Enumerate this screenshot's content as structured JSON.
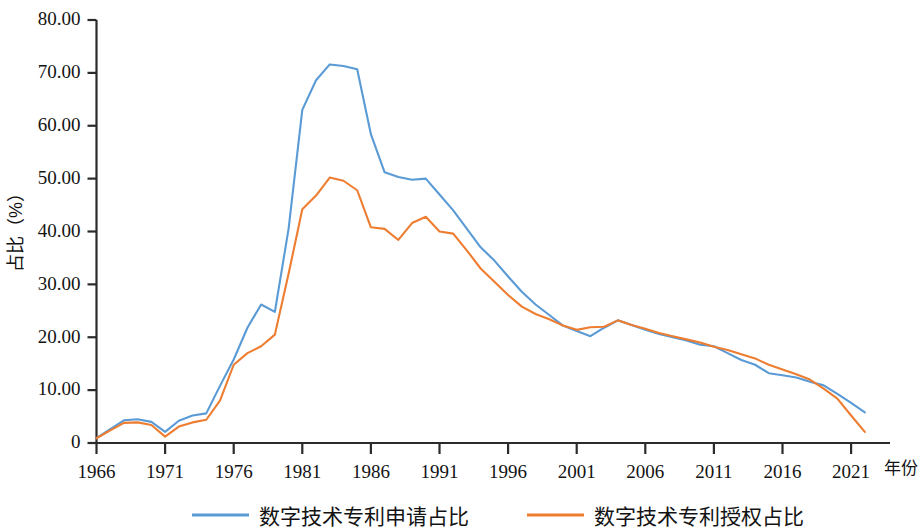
{
  "chart_data": {
    "type": "line",
    "title": "",
    "xlabel": "年份",
    "ylabel": "占比（%）",
    "xlim": [
      1966,
      2022
    ],
    "ylim": [
      0,
      80
    ],
    "grid": false,
    "legend_position": "bottom",
    "x_ticks": [
      "1966",
      "1971",
      "1976",
      "1981",
      "1986",
      "1991",
      "1996",
      "2001",
      "2006",
      "2011",
      "2016",
      "2021"
    ],
    "x_tick_values": [
      1966,
      1971,
      1976,
      1981,
      1986,
      1991,
      1996,
      2001,
      2006,
      2011,
      2016,
      2021
    ],
    "y_ticks": [
      "0",
      "10.00",
      "20.00",
      "30.00",
      "40.00",
      "50.00",
      "60.00",
      "70.00",
      "80.00"
    ],
    "y_tick_values": [
      0,
      10,
      20,
      30,
      40,
      50,
      60,
      70,
      80
    ],
    "x": [
      1966,
      1967,
      1968,
      1969,
      1970,
      1971,
      1972,
      1973,
      1974,
      1975,
      1976,
      1977,
      1978,
      1979,
      1980,
      1981,
      1982,
      1983,
      1984,
      1985,
      1986,
      1987,
      1988,
      1989,
      1990,
      1991,
      1992,
      1993,
      1994,
      1995,
      1996,
      1997,
      1998,
      1999,
      2000,
      2001,
      2002,
      2003,
      2004,
      2005,
      2006,
      2007,
      2008,
      2009,
      2010,
      2011,
      2012,
      2013,
      2014,
      2015,
      2016,
      2017,
      2018,
      2019,
      2020,
      2021,
      2022
    ],
    "series": [
      {
        "name": "数字技术专利申请占比",
        "color": "#5B9BD5",
        "values": [
          0.9,
          2.6,
          4.3,
          4.5,
          4.0,
          2.1,
          4.2,
          5.2,
          5.6,
          10.8,
          15.8,
          21.8,
          26.2,
          24.8,
          40.5,
          63.0,
          68.6,
          71.6,
          71.3,
          70.7,
          58.4,
          51.2,
          50.3,
          49.8,
          50.0,
          47.0,
          44.0,
          40.5,
          37.0,
          34.5,
          31.5,
          28.6,
          26.2,
          24.2,
          22.2,
          21.2,
          20.2,
          21.8,
          23.2,
          22.3,
          21.4,
          20.6,
          20.0,
          19.4,
          18.6,
          18.3,
          17.0,
          15.7,
          14.8,
          13.2,
          12.8,
          12.4,
          11.6,
          10.9,
          9.3,
          7.6,
          5.8
        ]
      },
      {
        "name": "数字技术专利授权占比",
        "color": "#ED7D31",
        "values": [
          0.9,
          2.4,
          3.8,
          3.9,
          3.4,
          1.2,
          3.1,
          3.9,
          4.4,
          8.0,
          14.8,
          17.0,
          18.3,
          20.5,
          32.0,
          44.2,
          46.8,
          50.2,
          49.6,
          47.8,
          40.8,
          40.5,
          38.4,
          41.6,
          42.8,
          40.0,
          39.6,
          36.4,
          33.0,
          30.5,
          28.0,
          25.8,
          24.4,
          23.4,
          22.2,
          21.4,
          21.9,
          22.0,
          23.2,
          22.3,
          21.6,
          20.8,
          20.2,
          19.6,
          19.0,
          18.2,
          17.6,
          16.8,
          16.0,
          14.8,
          13.9,
          13.0,
          12.0,
          10.3,
          8.4,
          5.2,
          2.1
        ]
      }
    ]
  },
  "legend": {
    "items": [
      {
        "label": "数字技术专利申请占比",
        "color": "#5B9BD5"
      },
      {
        "label": "数字技术专利授权占比",
        "color": "#ED7D31"
      }
    ]
  },
  "axes": {
    "y_title": "占比（%）",
    "x_title": "年份"
  }
}
